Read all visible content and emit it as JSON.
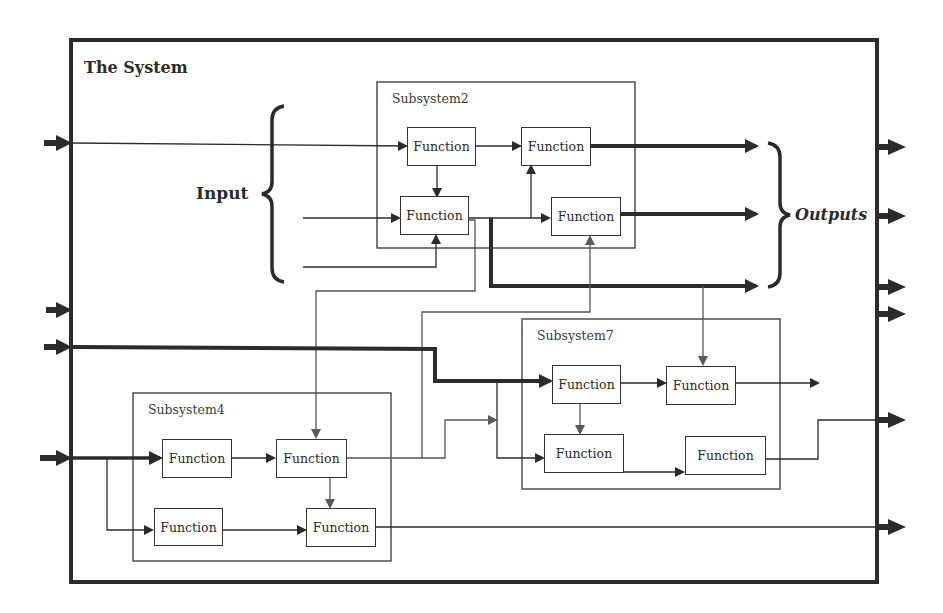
{
  "diagram": {
    "title": "The System",
    "input_label": "Input",
    "outputs_label": "Outputs",
    "colors": {
      "line": "#2b2b2b",
      "thin_line": "#3c3c3c",
      "gray_arrow": "#5a5a5a",
      "background": "#ffffff"
    },
    "subsystems": [
      {
        "id": "subsystem2",
        "label": "Subsystem2",
        "functions": [
          "Function",
          "Function",
          "Function",
          "Function"
        ]
      },
      {
        "id": "subsystem4",
        "label": "Subsystem4",
        "functions": [
          "Function",
          "Function",
          "Function",
          "Function"
        ]
      },
      {
        "id": "subsystem7",
        "label": "Subsystem7",
        "functions": [
          "Function",
          "Function",
          "Function",
          "Function"
        ]
      }
    ],
    "external_inputs": 4,
    "external_outputs": 6
  }
}
